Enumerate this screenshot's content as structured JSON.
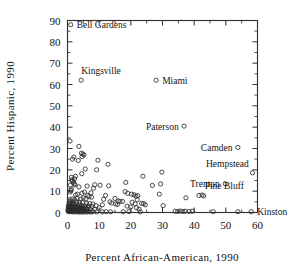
{
  "chart_data": {
    "type": "scatter",
    "title": "",
    "xlabel": "Percent African-American, 1990",
    "ylabel": "Percent Hispanic, 1990",
    "xlim": [
      0,
      60
    ],
    "ylim": [
      0,
      90
    ],
    "xticks": [
      0,
      10,
      20,
      30,
      40,
      50,
      60
    ],
    "yticks": [
      0,
      10,
      20,
      30,
      40,
      50,
      60,
      70,
      80,
      90
    ],
    "xtick_labels": [
      "0",
      "10",
      "20",
      "30",
      "40",
      "50",
      "60"
    ],
    "ytick_labels": [
      "0",
      "10",
      "20",
      "30",
      "40",
      "50",
      "60",
      "70",
      "80",
      "90"
    ],
    "grid": false,
    "legend": false,
    "marker": "open-circle",
    "minor_ticks": true,
    "tick_direction": "in",
    "frame": "box",
    "annotations": [
      {
        "label": "Bell Gardens",
        "x": 1.0,
        "y": 88.0,
        "anchor": "right"
      },
      {
        "label": "Kingsville",
        "x": 4.0,
        "y": 62.0,
        "anchor": "above-right"
      },
      {
        "label": "Miami",
        "x": 28.0,
        "y": 62.0,
        "anchor": "right"
      },
      {
        "label": "Paterson",
        "x": 37.0,
        "y": 40.5,
        "anchor": "left"
      },
      {
        "label": "Camden",
        "x": 54.0,
        "y": 30.5,
        "anchor": "left"
      },
      {
        "label": "Hempstead",
        "x": 58.5,
        "y": 18.5,
        "anchor": "above-left"
      },
      {
        "label": "Trenton",
        "x": 50.0,
        "y": 13.5,
        "anchor": "left"
      },
      {
        "label": "Pine Bluff",
        "x": 43.0,
        "y": 8.0,
        "anchor": "above-right"
      },
      {
        "label": "Kinston",
        "x": 58.0,
        "y": 0.5,
        "anchor": "right"
      }
    ],
    "points": [
      [
        1.0,
        88.0
      ],
      [
        4.3,
        62.0
      ],
      [
        28.0,
        62.0
      ],
      [
        36.8,
        40.5
      ],
      [
        53.8,
        30.5
      ],
      [
        58.4,
        18.6
      ],
      [
        49.8,
        13.5
      ],
      [
        41.5,
        8.0
      ],
      [
        43.0,
        7.8
      ],
      [
        58.0,
        0.4
      ],
      [
        0.8,
        33.5
      ],
      [
        3.6,
        31.0
      ],
      [
        2.0,
        26.0
      ],
      [
        1.6,
        25.0
      ],
      [
        4.4,
        27.8
      ],
      [
        4.9,
        27.4
      ],
      [
        4.6,
        26.2
      ],
      [
        5.2,
        27.0
      ],
      [
        3.4,
        24.4
      ],
      [
        9.6,
        24.5
      ],
      [
        12.8,
        22.6
      ],
      [
        5.6,
        20.4
      ],
      [
        9.2,
        20.0
      ],
      [
        4.5,
        18.2
      ],
      [
        1.2,
        16.5
      ],
      [
        1.4,
        15.3
      ],
      [
        1.5,
        14.8
      ],
      [
        0.9,
        12.8
      ],
      [
        1.2,
        11.0
      ],
      [
        1.1,
        10.3
      ],
      [
        0.9,
        9.6
      ],
      [
        2.1,
        13.4
      ],
      [
        2.4,
        13.0
      ],
      [
        3.6,
        12.0
      ],
      [
        8.6,
        13.0
      ],
      [
        10.3,
        12.8
      ],
      [
        13.0,
        12.5
      ],
      [
        8.2,
        11.4
      ],
      [
        18.4,
        14.1
      ],
      [
        23.8,
        17.0
      ],
      [
        29.8,
        18.9
      ],
      [
        29.4,
        13.4
      ],
      [
        26.8,
        12.7
      ],
      [
        42.5,
        8.2
      ],
      [
        37.4,
        6.9
      ],
      [
        29.0,
        8.6
      ],
      [
        30.2,
        3.2
      ],
      [
        18.2,
        9.8
      ],
      [
        19.0,
        9.0
      ],
      [
        20.2,
        8.6
      ],
      [
        21.0,
        8.3
      ],
      [
        21.6,
        7.6
      ],
      [
        22.2,
        7.9
      ],
      [
        22.0,
        6.0
      ],
      [
        20.4,
        4.8
      ],
      [
        21.4,
        4.1
      ],
      [
        23.4,
        4.3
      ],
      [
        15.0,
        6.6
      ],
      [
        16.0,
        5.4
      ],
      [
        16.6,
        5.2
      ],
      [
        17.4,
        5.2
      ],
      [
        13.4,
        5.0
      ],
      [
        14.0,
        4.4
      ],
      [
        15.2,
        4.0
      ],
      [
        15.8,
        3.8
      ],
      [
        11.0,
        3.6
      ],
      [
        10.0,
        2.3
      ],
      [
        6.4,
        8.0
      ],
      [
        6.8,
        7.4
      ],
      [
        7.6,
        7.2
      ],
      [
        5.4,
        9.6
      ],
      [
        4.6,
        9.0
      ],
      [
        3.2,
        8.6
      ],
      [
        2.6,
        8.2
      ],
      [
        5.0,
        6.8
      ],
      [
        5.8,
        6.4
      ],
      [
        4.2,
        6.2
      ],
      [
        3.0,
        6.6
      ],
      [
        2.2,
        6.0
      ],
      [
        1.5,
        6.4
      ],
      [
        0.7,
        6.0
      ],
      [
        0.6,
        5.2
      ],
      [
        1.0,
        4.9
      ],
      [
        1.8,
        5.0
      ],
      [
        2.8,
        5.0
      ],
      [
        3.8,
        4.8
      ],
      [
        4.8,
        4.6
      ],
      [
        6.0,
        4.4
      ],
      [
        7.0,
        4.2
      ],
      [
        8.0,
        4.0
      ],
      [
        9.0,
        3.2
      ],
      [
        0.5,
        4.2
      ],
      [
        1.3,
        4.0
      ],
      [
        2.0,
        3.9
      ],
      [
        2.9,
        3.8
      ],
      [
        3.7,
        3.6
      ],
      [
        4.4,
        3.4
      ],
      [
        5.5,
        3.2
      ],
      [
        6.6,
        3.0
      ],
      [
        7.8,
        2.8
      ],
      [
        0.4,
        3.4
      ],
      [
        0.9,
        3.2
      ],
      [
        1.6,
        3.1
      ],
      [
        2.3,
        3.0
      ],
      [
        3.1,
        2.9
      ],
      [
        3.9,
        2.7
      ],
      [
        4.7,
        2.6
      ],
      [
        5.6,
        2.4
      ],
      [
        6.5,
        2.2
      ],
      [
        0.3,
        2.7
      ],
      [
        0.8,
        2.6
      ],
      [
        1.4,
        2.5
      ],
      [
        2.1,
        2.4
      ],
      [
        2.7,
        2.3
      ],
      [
        3.4,
        2.2
      ],
      [
        4.1,
        2.0
      ],
      [
        5.0,
        1.9
      ],
      [
        6.0,
        1.8
      ],
      [
        7.2,
        1.7
      ],
      [
        8.6,
        1.6
      ],
      [
        0.3,
        2.1
      ],
      [
        0.7,
        2.0
      ],
      [
        1.2,
        1.9
      ],
      [
        1.8,
        1.8
      ],
      [
        2.4,
        1.8
      ],
      [
        3.0,
        1.7
      ],
      [
        3.6,
        1.6
      ],
      [
        4.3,
        1.5
      ],
      [
        5.2,
        1.4
      ],
      [
        6.2,
        1.3
      ],
      [
        0.2,
        1.5
      ],
      [
        0.6,
        1.4
      ],
      [
        1.0,
        1.3
      ],
      [
        1.5,
        1.3
      ],
      [
        2.0,
        1.2
      ],
      [
        2.6,
        1.2
      ],
      [
        3.2,
        1.1
      ],
      [
        3.9,
        1.0
      ],
      [
        4.6,
        1.0
      ],
      [
        5.4,
        0.9
      ],
      [
        0.2,
        1.0
      ],
      [
        0.5,
        0.9
      ],
      [
        0.9,
        0.9
      ],
      [
        1.3,
        0.8
      ],
      [
        1.7,
        0.8
      ],
      [
        2.2,
        0.7
      ],
      [
        2.8,
        0.7
      ],
      [
        3.4,
        0.6
      ],
      [
        4.0,
        0.6
      ],
      [
        4.8,
        0.5
      ],
      [
        5.8,
        0.5
      ],
      [
        6.8,
        0.4
      ],
      [
        8.0,
        0.4
      ],
      [
        0.2,
        0.5
      ],
      [
        0.6,
        0.4
      ],
      [
        1.1,
        0.4
      ],
      [
        1.6,
        0.3
      ],
      [
        2.2,
        0.3
      ],
      [
        2.9,
        0.3
      ],
      [
        3.6,
        0.2
      ],
      [
        4.4,
        0.2
      ],
      [
        5.2,
        0.2
      ],
      [
        6.2,
        0.2
      ],
      [
        7.4,
        0.2
      ],
      [
        9.2,
        0.3
      ],
      [
        11.0,
        0.3
      ],
      [
        12.2,
        0.4
      ],
      [
        13.6,
        0.3
      ],
      [
        17.6,
        0.4
      ],
      [
        19.4,
        0.4
      ],
      [
        23.0,
        0.3
      ],
      [
        34.0,
        0.6
      ],
      [
        34.8,
        0.5
      ],
      [
        35.6,
        0.7
      ],
      [
        36.4,
        0.5
      ],
      [
        37.2,
        0.6
      ],
      [
        38.4,
        0.5
      ],
      [
        39.4,
        0.6
      ],
      [
        46.0,
        0.4
      ],
      [
        53.8,
        0.4
      ],
      [
        24.0,
        4.2
      ],
      [
        24.6,
        3.6
      ],
      [
        6.2,
        12.4
      ],
      [
        7.4,
        9.2
      ],
      [
        2.5,
        17.0
      ],
      [
        2.2,
        15.8
      ],
      [
        1.9,
        14.2
      ],
      [
        12.0,
        8.0
      ],
      [
        11.4,
        6.2
      ],
      [
        18.8,
        3.0
      ],
      [
        20.0,
        2.6
      ],
      [
        21.8,
        2.2
      ],
      [
        22.6,
        1.6
      ]
    ]
  }
}
